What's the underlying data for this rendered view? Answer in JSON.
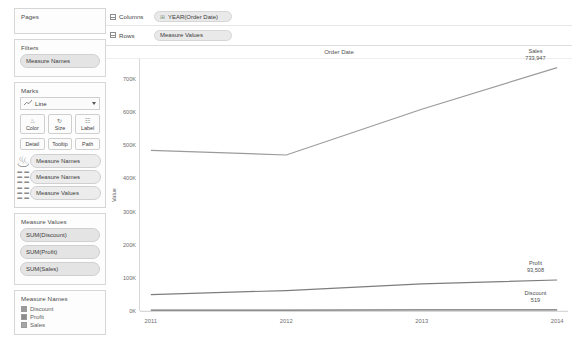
{
  "sidebar": {
    "pages": {
      "title": "Pages"
    },
    "filters": {
      "title": "Filters",
      "items": [
        "Measure Names"
      ]
    },
    "marks": {
      "title": "Marks",
      "mark_type": "Line",
      "mark_type_icon": "line-chart-icon",
      "buttons": [
        {
          "label": "Color",
          "icon": "color-palette-icon",
          "glyph": "⚘"
        },
        {
          "label": "Size",
          "icon": "size-icon",
          "glyph": "↻"
        },
        {
          "label": "Label",
          "icon": "label-icon",
          "glyph": "☷"
        }
      ],
      "buttons_row2": [
        {
          "label": "Detail",
          "icon": "detail-icon"
        },
        {
          "label": "Tooltip",
          "icon": "tooltip-icon"
        },
        {
          "label": "Path",
          "icon": "path-icon"
        }
      ],
      "cards": [
        {
          "label": "Measure Names",
          "icon": "color-palette-icon",
          "glyph": "⚘"
        },
        {
          "label": "Measure Names",
          "icon": "label-icon",
          "glyph": "☷"
        },
        {
          "label": "Measure Values",
          "icon": "path-icon",
          "glyph": "☷"
        }
      ]
    },
    "measure_values": {
      "title": "Measure Values",
      "items": [
        "SUM(Discount)",
        "SUM(Profit)",
        "SUM(Sales)"
      ]
    },
    "measure_names": {
      "title": "Measure Names",
      "items": [
        {
          "label": "Discount",
          "color": "#9a9a9a"
        },
        {
          "label": "Profit",
          "color": "#8c8c8c"
        },
        {
          "label": "Sales",
          "color": "#a5a5a5"
        }
      ]
    }
  },
  "shelves": {
    "columns": {
      "label": "Columns",
      "pill": "YEAR(Order Date)",
      "pill_icon": "plus-box-icon"
    },
    "rows": {
      "label": "Rows",
      "pill": "Measure Values",
      "pill_icon": "grid-icon"
    }
  },
  "chart_data": {
    "type": "line",
    "title": "Order Date",
    "xlabel": "",
    "ylabel": "Value",
    "grid": true,
    "legend_position": "right-inline",
    "x": [
      2011,
      2012,
      2013,
      2014
    ],
    "xtick_labels": [
      "2011",
      "2012",
      "2013",
      "2014"
    ],
    "ytick_labels": [
      "0K",
      "100K",
      "200K",
      "300K",
      "400K",
      "500K",
      "600K",
      "700K"
    ],
    "ytick_values": [
      0,
      100000,
      200000,
      300000,
      400000,
      500000,
      600000,
      700000
    ],
    "ylim": [
      0,
      760000
    ],
    "series": [
      {
        "name": "Sales",
        "color": "#9b9b9b",
        "values": [
          484247,
          470533,
          608474,
          733947
        ],
        "end_label": "Sales",
        "end_value_label": "733,947"
      },
      {
        "name": "Profit",
        "color": "#7d7d7d",
        "values": [
          49544,
          61619,
          81795,
          93508
        ],
        "end_label": "Profit",
        "end_value_label": "93,508"
      },
      {
        "name": "Discount",
        "color": "#6f6f6f",
        "values": [
          2490,
          2780,
          3160,
          3520
        ],
        "end_label": "Discount",
        "end_value_label": "519"
      }
    ]
  }
}
